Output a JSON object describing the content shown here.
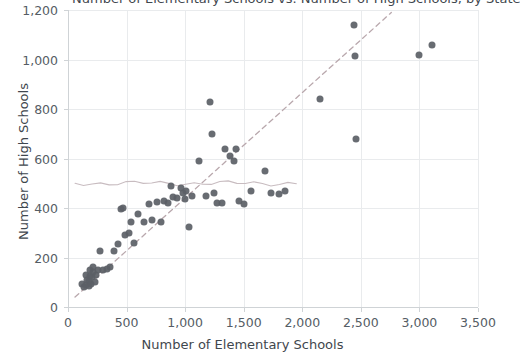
{
  "chart_data": {
    "type": "scatter",
    "title": "Number of Elementary Schools vs. Number of High Schools, by State",
    "xlabel": "Number of Elementary Schools",
    "ylabel": "Number of High Schools",
    "xlim": [
      0,
      3500
    ],
    "ylim": [
      0,
      1200
    ],
    "xticks": [
      0,
      500,
      1000,
      1500,
      2000,
      2500,
      3000,
      3500
    ],
    "xtick_labels": [
      "0",
      "500",
      "1,000",
      "1,500",
      "2,000",
      "2,500",
      "3,000",
      "3,500"
    ],
    "yticks": [
      0,
      200,
      400,
      600,
      800,
      1000,
      1200
    ],
    "ytick_labels": [
      "0",
      "200",
      "400",
      "600",
      "800",
      "1,000",
      "1,200"
    ],
    "grid": true,
    "legend": "none",
    "marker_color": "#5b6066",
    "trendline": {
      "type": "linear-dashed",
      "color": "#b9a8ad",
      "x_start": 60,
      "y_start": 40,
      "x_end": 2760,
      "y_end": 1190
    },
    "reference_line": {
      "type": "horizontal-irregular",
      "color": "#c8bcc0",
      "y": 500,
      "x_start": 60,
      "x_end": 1950
    },
    "points": [
      [
        120,
        95
      ],
      [
        135,
        80
      ],
      [
        150,
        90
      ],
      [
        160,
        110
      ],
      [
        150,
        130
      ],
      [
        175,
        85
      ],
      [
        180,
        105
      ],
      [
        185,
        125
      ],
      [
        190,
        150
      ],
      [
        200,
        95
      ],
      [
        205,
        120
      ],
      [
        210,
        140
      ],
      [
        215,
        160
      ],
      [
        230,
        100
      ],
      [
        240,
        130
      ],
      [
        255,
        150
      ],
      [
        270,
        225
      ],
      [
        300,
        150
      ],
      [
        330,
        155
      ],
      [
        360,
        160
      ],
      [
        390,
        225
      ],
      [
        430,
        255
      ],
      [
        450,
        395
      ],
      [
        470,
        400
      ],
      [
        490,
        290
      ],
      [
        520,
        300
      ],
      [
        540,
        345
      ],
      [
        560,
        260
      ],
      [
        600,
        375
      ],
      [
        650,
        345
      ],
      [
        690,
        415
      ],
      [
        720,
        350
      ],
      [
        760,
        425
      ],
      [
        790,
        345
      ],
      [
        820,
        430
      ],
      [
        850,
        420
      ],
      [
        880,
        490
      ],
      [
        900,
        445
      ],
      [
        930,
        440
      ],
      [
        960,
        480
      ],
      [
        980,
        460
      ],
      [
        1000,
        435
      ],
      [
        1010,
        470
      ],
      [
        1030,
        325
      ],
      [
        1060,
        450
      ],
      [
        1120,
        590
      ],
      [
        1180,
        450
      ],
      [
        1210,
        830
      ],
      [
        1230,
        700
      ],
      [
        1250,
        460
      ],
      [
        1270,
        420
      ],
      [
        1310,
        420
      ],
      [
        1340,
        640
      ],
      [
        1380,
        610
      ],
      [
        1420,
        590
      ],
      [
        1430,
        640
      ],
      [
        1460,
        430
      ],
      [
        1500,
        415
      ],
      [
        1560,
        470
      ],
      [
        1680,
        550
      ],
      [
        1730,
        460
      ],
      [
        1800,
        455
      ],
      [
        1850,
        470
      ],
      [
        2150,
        840
      ],
      [
        2440,
        1140
      ],
      [
        2450,
        1015
      ],
      [
        2460,
        680
      ],
      [
        3000,
        1020
      ],
      [
        3110,
        1060
      ]
    ]
  }
}
